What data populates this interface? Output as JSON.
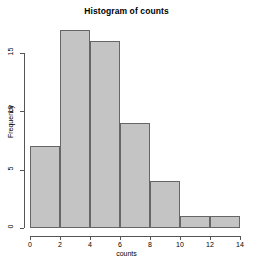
{
  "chart_data": {
    "type": "bar",
    "title": "Histogram of counts",
    "xlabel": "counts",
    "ylabel": "Frequency",
    "bin_edges": [
      0,
      2,
      4,
      6,
      8,
      10,
      12,
      14
    ],
    "categories": [
      "0-2",
      "2-4",
      "4-6",
      "6-8",
      "8-10",
      "10-12",
      "12-14"
    ],
    "values": [
      7,
      17,
      16,
      9,
      4,
      1,
      1
    ],
    "xlim": [
      0,
      14
    ],
    "ylim": [
      0,
      17.5
    ],
    "xticks": [
      0,
      2,
      4,
      6,
      8,
      10,
      12,
      14
    ],
    "xtick_labels": [
      "0",
      "2",
      "4",
      "6",
      "8",
      "10",
      "12",
      "14"
    ],
    "yticks": [
      0,
      5,
      10,
      15
    ],
    "ytick_labels": [
      "0",
      "5",
      "10",
      "15"
    ],
    "grid": false,
    "legend": false,
    "bar_fill_color": "#c4c4c4",
    "bar_border_color": "#666666",
    "axis_color": "#555555",
    "background_color": "#ffffff"
  }
}
